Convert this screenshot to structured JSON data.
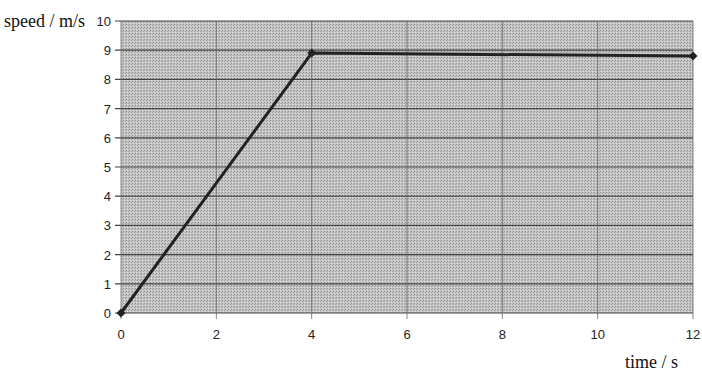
{
  "chart_data": {
    "type": "line",
    "title": "",
    "xlabel": "time / s",
    "ylabel": "speed / m/s",
    "xlim": [
      0,
      12
    ],
    "ylim": [
      0,
      10
    ],
    "x_ticks": [
      0,
      2,
      4,
      6,
      8,
      10,
      12
    ],
    "y_ticks": [
      0,
      1,
      2,
      3,
      4,
      5,
      6,
      7,
      8,
      9,
      10
    ],
    "grid": true,
    "legend": null,
    "series": [
      {
        "name": "speed",
        "color": "#222222",
        "marker": "diamond",
        "x": [
          0,
          4,
          12
        ],
        "y": [
          0,
          8.9,
          8.8
        ]
      }
    ]
  },
  "colors": {
    "plot_background": "#b9b9b9",
    "gridline": "#444444",
    "line": "#1a1a1a"
  }
}
